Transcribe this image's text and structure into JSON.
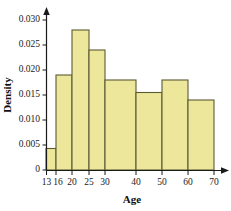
{
  "chart_data": {
    "type": "bar",
    "title": "",
    "subtitle": "",
    "xlabel": "Age",
    "ylabel": "Density",
    "grid": false,
    "legend": "none",
    "xlim": [
      13,
      70
    ],
    "ylim": [
      0,
      0.0315
    ],
    "x_tick_labels": [
      "13",
      "16",
      "20",
      "25",
      "30",
      "40",
      "50",
      "60",
      "70"
    ],
    "x_tick_values": [
      13,
      16,
      20,
      25,
      30,
      40,
      50,
      60,
      70
    ],
    "y_tick_labels": [
      "0",
      "0.005",
      "0.010",
      "0.015",
      "0.020",
      "0.025",
      "0.030"
    ],
    "y_tick_values": [
      0,
      0.005,
      0.01,
      0.015,
      0.02,
      0.025,
      0.03
    ],
    "bin_edges": [
      13,
      16,
      20,
      25,
      30,
      40,
      50,
      60,
      70
    ],
    "values": [
      0.0043,
      0.019,
      0.028,
      0.024,
      0.018,
      0.0155,
      0.018,
      0.014
    ],
    "bars": [
      {
        "label": "13-16",
        "x0": 13,
        "x1": 16,
        "density": 0.0043
      },
      {
        "label": "16-20",
        "x0": 16,
        "x1": 20,
        "density": 0.019
      },
      {
        "label": "20-25",
        "x0": 20,
        "x1": 25,
        "density": 0.028
      },
      {
        "label": "25-30",
        "x0": 25,
        "x1": 30,
        "density": 0.024
      },
      {
        "label": "30-40",
        "x0": 30,
        "x1": 40,
        "density": 0.018
      },
      {
        "label": "40-50",
        "x0": 40,
        "x1": 50,
        "density": 0.0155
      },
      {
        "label": "50-60",
        "x0": 50,
        "x1": 60,
        "density": 0.018
      },
      {
        "label": "60-70",
        "x0": 60,
        "x1": 70,
        "density": 0.014
      }
    ],
    "colors": {
      "bar_fill": "#ece79b",
      "bar_stroke": "#5c5a33",
      "axis": "#1a1a1a",
      "text": "#1a1a1a"
    },
    "annotations": []
  },
  "watermark": {
    "line1": "",
    "line2": ""
  }
}
